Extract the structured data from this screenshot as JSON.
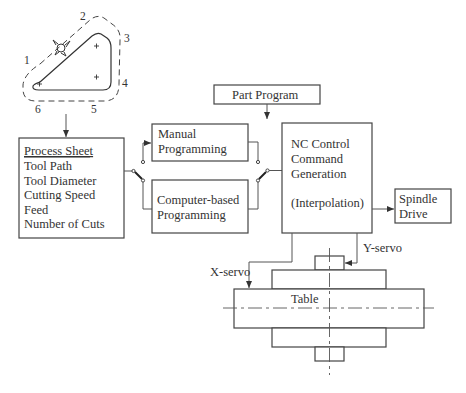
{
  "diagram": {
    "type": "nc-machining-flow",
    "tool_path": {
      "point_labels": [
        "1",
        "2",
        "3",
        "4",
        "5",
        "6"
      ]
    },
    "process_sheet": {
      "title": "Process Sheet",
      "items": [
        "Tool Path",
        "Tool Diameter",
        "Cutting Speed",
        "Feed",
        "Number of Cuts"
      ]
    },
    "manual_programming": {
      "line1": "Manual",
      "line2": "Programming"
    },
    "computer_programming": {
      "line1": "Computer-based",
      "line2": "Programming"
    },
    "part_program": {
      "label": "Part Program"
    },
    "nc_control": {
      "line1": "NC Control",
      "line2": "Command",
      "line3": "Generation",
      "line4": "(Interpolation)"
    },
    "spindle_drive": {
      "line1": "Spindle",
      "line2": "Drive"
    },
    "x_servo": {
      "label": "X-servo"
    },
    "y_servo": {
      "label": "Y-servo"
    },
    "table": {
      "label": "Table"
    },
    "colors": {
      "line": "#444444",
      "text": "#333333",
      "background": "#ffffff"
    }
  }
}
